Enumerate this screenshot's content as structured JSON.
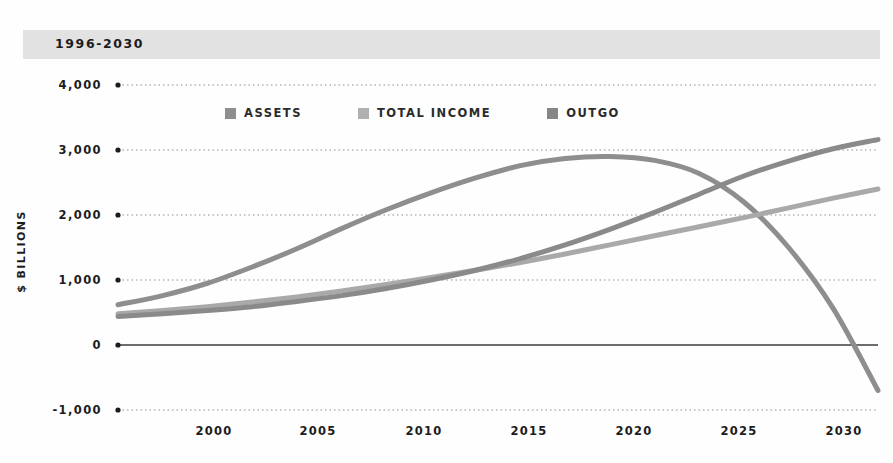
{
  "header": {
    "title": "1996-2030"
  },
  "chart_data": {
    "type": "line",
    "title": "1996-2030",
    "xlabel": "",
    "ylabel": "$ BILLIONS",
    "xlim": [
      1996,
      2030
    ],
    "ylim": [
      -1000,
      4000
    ],
    "grid": true,
    "legend_position": "top-center",
    "x_ticks": [
      "2000",
      "2005",
      "2010",
      "2015",
      "2020",
      "2025",
      "2030"
    ],
    "x_tick_values": [
      2000,
      2005,
      2010,
      2015,
      2020,
      2025,
      2030
    ],
    "y_ticks": [
      "4,000",
      "3,000",
      "2,000",
      "1,000",
      "0",
      "-1,000"
    ],
    "y_tick_values": [
      4000,
      3000,
      2000,
      1000,
      0,
      -1000
    ],
    "x": [
      1996,
      1998,
      2000,
      2002,
      2004,
      2006,
      2008,
      2010,
      2012,
      2014,
      2016,
      2018,
      2020,
      2022,
      2024,
      2026,
      2028,
      2030
    ],
    "series": [
      {
        "name": "ASSETS",
        "color": "#8e8e8e",
        "values": [
          620,
          760,
          950,
          1200,
          1480,
          1790,
          2080,
          2340,
          2570,
          2760,
          2870,
          2900,
          2840,
          2640,
          2200,
          1500,
          560,
          -700
        ]
      },
      {
        "name": "TOTAL INCOME",
        "color": "#a9a9a9",
        "values": [
          480,
          530,
          590,
          660,
          740,
          830,
          930,
          1040,
          1150,
          1270,
          1400,
          1540,
          1680,
          1820,
          1960,
          2110,
          2260,
          2400
        ]
      },
      {
        "name": "OUTGO",
        "color": "#8a8a8a",
        "values": [
          440,
          480,
          530,
          590,
          670,
          760,
          870,
          1000,
          1150,
          1330,
          1540,
          1780,
          2040,
          2320,
          2600,
          2830,
          3020,
          3160
        ]
      }
    ]
  },
  "legend": {
    "items": [
      {
        "label": "ASSETS",
        "color": "#8e8e8e"
      },
      {
        "label": "TOTAL INCOME",
        "color": "#b0b0b0"
      },
      {
        "label": "OUTGO",
        "color": "#868686"
      }
    ]
  },
  "axis": {
    "y_title": "$ BILLIONS"
  },
  "colors": {
    "band_background": "#e2e2e2",
    "gridline": "#8f8f8f",
    "zero_line": "#3b3b3b",
    "text": "#1c1c1c"
  }
}
